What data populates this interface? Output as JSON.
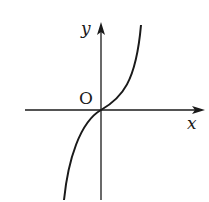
{
  "diagram": {
    "type": "function-graph",
    "labels": {
      "y_axis": "y",
      "x_axis": "x",
      "origin": "O"
    },
    "colors": {
      "stroke": "#1a1a1a",
      "background": "#ffffff"
    }
  }
}
